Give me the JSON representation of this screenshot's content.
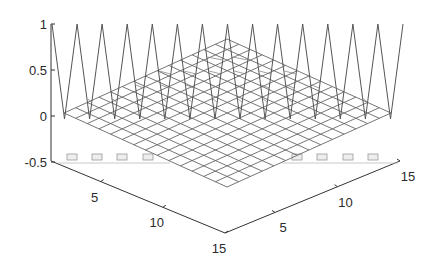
{
  "chart_data": {
    "type": "surface",
    "title": "",
    "xlabel": "",
    "ylabel": "",
    "zlabel": "",
    "grid_size": [
      15,
      15
    ],
    "x_ticks": [
      5,
      10,
      15
    ],
    "y_ticks": [
      5,
      10,
      15
    ],
    "z_ticks": [
      -0.5,
      0,
      0.5,
      1
    ],
    "z_tick_labels": [
      "-0.5",
      "0",
      "0.5",
      "1"
    ],
    "x_tick_labels": [
      "5",
      "10",
      "15"
    ],
    "y_tick_labels": [
      "5",
      "10",
      "15"
    ],
    "zlim": [
      -0.5,
      1
    ],
    "xlim": [
      1,
      15
    ],
    "ylim": [
      1,
      15
    ],
    "back_edge_values": [
      1,
      0,
      1,
      0,
      1,
      0,
      1,
      0,
      1,
      0,
      1,
      0,
      1,
      0,
      1
    ],
    "interior_value": 0,
    "mesh_color": "#555555"
  }
}
